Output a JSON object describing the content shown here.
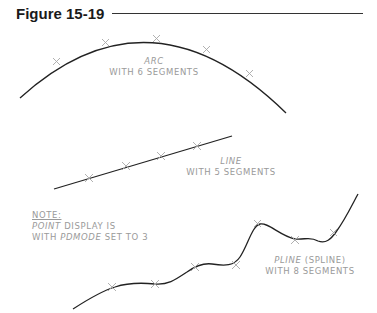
{
  "figure": {
    "title": "Figure 15-19"
  },
  "arc": {
    "label_name": "ARC",
    "label_desc": "WITH 6 SEGMENTS",
    "segments": 6
  },
  "line": {
    "label_name": "LINE",
    "label_desc": "WITH 5 SEGMENTS",
    "segments": 5
  },
  "pline": {
    "label_name": "PLINE",
    "label_paren": "(SPLINE)",
    "label_desc": "WITH 8 SEGMENTS",
    "segments": 8
  },
  "note": {
    "heading": "NOTE:",
    "line1_italic": "POINT",
    "line1_rest": "DISPLAY IS",
    "line2_pre": "WITH",
    "line2_italic": "PDMODE",
    "line2_rest": "SET TO 3"
  },
  "colors": {
    "curve": "#222222",
    "marker": "#a8a8a8",
    "label": "#9a9a9a"
  }
}
